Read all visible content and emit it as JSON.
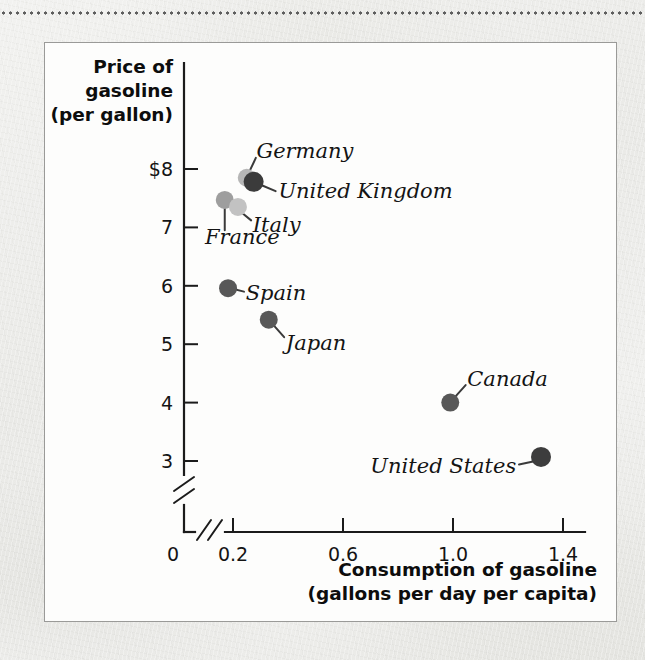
{
  "figure": {
    "background_color": "#efefed",
    "card_color": "#fdfdfc",
    "card_border_color": "#9a9a98",
    "top_rule": "dotted-rule"
  },
  "chart_data": {
    "type": "scatter",
    "title": "",
    "xlabel": "Consumption of gasoline",
    "xlabel_sub": "(gallons per day per capita)",
    "ylabel": "Price of",
    "ylabel_line2": "gasoline",
    "ylabel_line3": "(per gallon)",
    "xlim": [
      0.0,
      1.5
    ],
    "ylim": [
      2.6,
      8.3
    ],
    "grid": false,
    "legend": "none",
    "axis_break_x": true,
    "axis_break_y": true,
    "xticks": [
      {
        "value": 0.0,
        "label": "0"
      },
      {
        "value": 0.2,
        "label": "0.2"
      },
      {
        "value": 0.6,
        "label": "0.6"
      },
      {
        "value": 1.0,
        "label": "1.0"
      },
      {
        "value": 1.4,
        "label": "1.4"
      }
    ],
    "yticks": [
      {
        "value": 8,
        "label": "$8"
      },
      {
        "value": 7,
        "label": "7"
      },
      {
        "value": 6,
        "label": "6"
      },
      {
        "value": 5,
        "label": "5"
      },
      {
        "value": 4,
        "label": "4"
      },
      {
        "value": 3,
        "label": "3"
      }
    ],
    "points": [
      {
        "name": "Germany",
        "x": 0.25,
        "y": 7.85,
        "color": "#b6b6b6",
        "radius": 9,
        "label": "Germany",
        "label_x": 0.285,
        "label_y": 8.3,
        "label_anchor": "start",
        "leader_from": [
          0.262,
          7.98
        ],
        "leader_to": [
          0.283,
          8.19
        ]
      },
      {
        "name": "United Kingdom",
        "x": 0.275,
        "y": 7.78,
        "color": "#3b3b3b",
        "radius": 10,
        "label": "United Kingdom",
        "label_x": 0.365,
        "label_y": 7.62,
        "label_anchor": "start",
        "leader_from": [
          0.3,
          7.73
        ],
        "leader_to": [
          0.355,
          7.62
        ]
      },
      {
        "name": "France",
        "x": 0.17,
        "y": 7.47,
        "color": "#9e9e9e",
        "radius": 9,
        "label": "France",
        "label_x": 0.098,
        "label_y": 6.84,
        "label_anchor": "start",
        "leader_from": [
          0.17,
          7.34
        ],
        "leader_to": [
          0.17,
          6.95
        ]
      },
      {
        "name": "Italy",
        "x": 0.218,
        "y": 7.35,
        "color": "#c2c2c2",
        "radius": 9,
        "label": "Italy",
        "label_x": 0.272,
        "label_y": 7.04,
        "label_anchor": "start",
        "leader_from": [
          0.23,
          7.26
        ],
        "leader_to": [
          0.266,
          7.12
        ]
      },
      {
        "name": "Spain",
        "x": 0.182,
        "y": 5.96,
        "color": "#585858",
        "radius": 9,
        "label": "Spain",
        "label_x": 0.246,
        "label_y": 5.88,
        "label_anchor": "start",
        "leader_from": [
          0.198,
          5.95
        ],
        "leader_to": [
          0.24,
          5.9
        ]
      },
      {
        "name": "Japan",
        "x": 0.33,
        "y": 5.42,
        "color": "#585858",
        "radius": 9,
        "label": "Japan",
        "label_x": 0.392,
        "label_y": 5.02,
        "label_anchor": "start",
        "leader_from": [
          0.345,
          5.34
        ],
        "leader_to": [
          0.386,
          5.12
        ]
      },
      {
        "name": "Canada",
        "x": 0.99,
        "y": 4.0,
        "color": "#585858",
        "radius": 9,
        "label": "Canada",
        "label_x": 1.052,
        "label_y": 4.4,
        "label_anchor": "start",
        "leader_from": [
          1.006,
          4.09
        ],
        "leader_to": [
          1.046,
          4.3
        ]
      },
      {
        "name": "United States",
        "x": 1.32,
        "y": 3.07,
        "color": "#3d3d3d",
        "radius": 10,
        "label": "United States",
        "label_x": 1.23,
        "label_y": 2.92,
        "label_anchor": "end",
        "leader_from": [
          1.3,
          3.0
        ],
        "leader_to": [
          1.24,
          2.94
        ]
      }
    ]
  }
}
